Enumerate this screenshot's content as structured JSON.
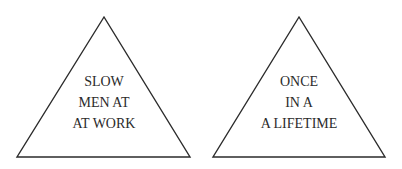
{
  "signs": [
    {
      "lines": [
        "SLOW",
        "MEN AT",
        "AT WORK"
      ],
      "shape": "triangle",
      "apex": [
        104,
        17
      ],
      "base_left": [
        17,
        157
      ],
      "base_right": [
        190,
        157
      ]
    },
    {
      "lines": [
        "ONCE",
        "IN A",
        "A LIFETIME"
      ],
      "shape": "triangle",
      "apex": [
        299,
        17
      ],
      "base_left": [
        213,
        157
      ],
      "base_right": [
        385,
        157
      ]
    }
  ],
  "colors": {
    "stroke": "#2b2b2b",
    "text": "#2b2b2b",
    "background": "#ffffff"
  }
}
